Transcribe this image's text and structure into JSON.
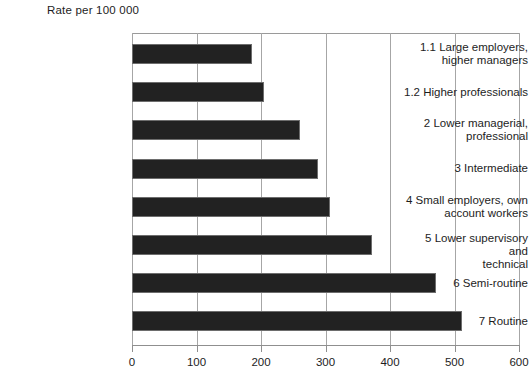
{
  "chart_data": {
    "type": "bar",
    "orientation": "horizontal",
    "title": "",
    "subtitle": "",
    "xlabel": "",
    "ylabel": "",
    "axis_title": "Rate per 100 000",
    "categories": [
      "1.1  Large employers,\nhigher managers",
      "1.2  Higher professionals",
      "2  Lower managerial,\nprofessional",
      "3  Intermediate",
      "4  Small employers, own\naccount workers",
      "5  Lower supervisory and\ntechnical",
      "6  Semi-routine",
      "7  Routine"
    ],
    "values": [
      186,
      205,
      260,
      288,
      307,
      372,
      471,
      512
    ],
    "xlim": [
      0,
      600
    ],
    "xticks": [
      0,
      100,
      200,
      300,
      400,
      500,
      600
    ],
    "xtick_labels": [
      "0",
      "100",
      "200",
      "300",
      "400",
      "500",
      "600"
    ],
    "grid": true,
    "grid_axis": "x",
    "legend": false,
    "bar_color": "#222222",
    "bar_border_color": "#6d6d6d",
    "grid_color": "#a6a6a6",
    "background_color": "#ffffff"
  }
}
